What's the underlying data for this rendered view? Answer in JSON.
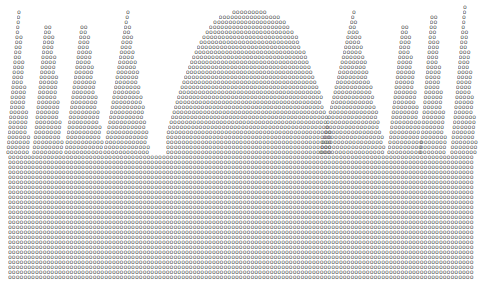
{
  "artwork": {
    "title": "Typewriter character-art silhouette of spires",
    "glyph": "o",
    "ink_color": "#5a5a5a",
    "background": "#ffffff",
    "row_pitch_px": 5,
    "col_pitch_px": 3.9,
    "canvas": {
      "width": 485,
      "height": 285
    },
    "base": {
      "top_row": 31,
      "bottom_row": 55,
      "left_px": 8,
      "right_px": 481
    },
    "peaks": [
      {
        "name": "spire-1",
        "center_px": 18,
        "apex_row": 2,
        "apex_half_px": 1,
        "base_half_px": 12,
        "base_row": 30
      },
      {
        "name": "spire-2",
        "center_px": 48,
        "apex_row": 5,
        "apex_half_px": 4,
        "base_half_px": 16,
        "base_row": 30
      },
      {
        "name": "spire-3",
        "center_px": 84,
        "apex_row": 5,
        "apex_half_px": 4,
        "base_half_px": 20,
        "base_row": 30
      },
      {
        "name": "spire-4",
        "center_px": 127,
        "apex_row": 2,
        "apex_half_px": 1,
        "base_half_px": 24,
        "base_row": 30
      },
      {
        "name": "dome",
        "center_px": 250,
        "apex_row": 2,
        "apex_half_px": 18,
        "base_half_px": 84,
        "base_row": 30
      },
      {
        "name": "spire-5",
        "center_px": 353,
        "apex_row": 2,
        "apex_half_px": 1,
        "base_half_px": 34,
        "base_row": 30
      },
      {
        "name": "spire-6",
        "center_px": 405,
        "apex_row": 5,
        "apex_half_px": 4,
        "base_half_px": 18,
        "base_row": 30
      },
      {
        "name": "spire-7",
        "center_px": 433,
        "apex_row": 3,
        "apex_half_px": 3,
        "base_half_px": 14,
        "base_row": 30
      },
      {
        "name": "spire-8",
        "center_px": 464,
        "apex_row": 1,
        "apex_half_px": 1,
        "base_half_px": 14,
        "base_row": 30
      }
    ]
  }
}
